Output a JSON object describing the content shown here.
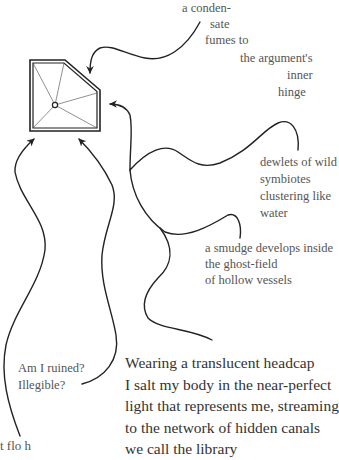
{
  "poem": {
    "top_fragment": [
      "a conden-",
      "sate",
      "fumes to",
      "the argument's",
      "inner",
      "hinge"
    ],
    "right_fragment": [
      "dewlets of wild",
      "symbiotes",
      "clustering like",
      "water"
    ],
    "middle_fragment": [
      "a smudge develops inside",
      "the ghost-field",
      "of hollow vessels"
    ],
    "left_fragment": [
      "Am I ruined?",
      "Illegible?"
    ],
    "main_paragraph": [
      "Wearing a translucent headcap",
      "I salt my body in the near-perfect",
      "light that represents me, streaming",
      "to the network of hidden canals",
      "we call the library"
    ],
    "clipped_bottom_line": "t flo        h"
  },
  "figure": {
    "shape": "pentagon-double-outline-with-center-point",
    "line_color": "#222222",
    "text_color": "#555555"
  }
}
